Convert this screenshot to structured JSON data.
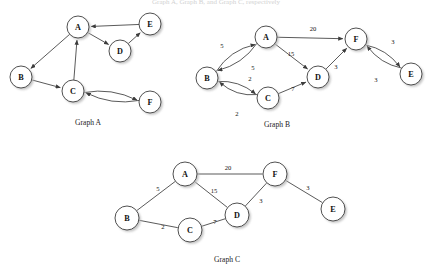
{
  "figure": {
    "background_color": "#ffffff",
    "node_fill": "#ffffff",
    "node_stroke": "#3c3c3c",
    "edge_color": "#3c3c3c",
    "text_color": "#111111",
    "top_clipped_text": "Graph A, Graph B, and Graph C, respectively"
  },
  "graphs": [
    {
      "id": "graph-a",
      "caption": "Graph A",
      "caption_pos": {
        "x": 88,
        "y": 122
      },
      "directed": true,
      "weighted": false,
      "nodes": [
        {
          "id": "A",
          "label": "A",
          "x": 78,
          "y": 27,
          "r": 11
        },
        {
          "id": "B",
          "label": "B",
          "x": 21,
          "y": 77,
          "r": 11
        },
        {
          "id": "C",
          "label": "C",
          "x": 73,
          "y": 91,
          "r": 11
        },
        {
          "id": "D",
          "label": "D",
          "x": 120,
          "y": 51,
          "r": 11
        },
        {
          "id": "E",
          "label": "E",
          "x": 150,
          "y": 24,
          "r": 11
        },
        {
          "id": "F",
          "label": "F",
          "x": 150,
          "y": 102,
          "r": 11
        }
      ],
      "edges": [
        {
          "from": "A",
          "to": "B",
          "weight": "",
          "curve": 0
        },
        {
          "from": "A",
          "to": "D",
          "weight": "",
          "curve": 0
        },
        {
          "from": "E",
          "to": "A",
          "weight": "",
          "curve": 0
        },
        {
          "from": "D",
          "to": "E",
          "weight": "",
          "curve": 0
        },
        {
          "from": "B",
          "to": "C",
          "weight": "",
          "curve": 0
        },
        {
          "from": "C",
          "to": "A",
          "weight": "",
          "curve": 0
        },
        {
          "from": "C",
          "to": "F",
          "weight": "",
          "curve": -9
        },
        {
          "from": "F",
          "to": "C",
          "weight": "",
          "curve": -9
        }
      ]
    },
    {
      "id": "graph-b",
      "caption": "Graph B",
      "caption_pos": {
        "x": 277,
        "y": 124
      },
      "directed": true,
      "weighted": true,
      "nodes": [
        {
          "id": "A",
          "label": "A",
          "x": 266,
          "y": 37,
          "r": 11
        },
        {
          "id": "B",
          "label": "B",
          "x": 207,
          "y": 78,
          "r": 11
        },
        {
          "id": "C",
          "label": "C",
          "x": 268,
          "y": 98,
          "r": 11
        },
        {
          "id": "D",
          "label": "D",
          "x": 318,
          "y": 77,
          "r": 11
        },
        {
          "id": "E",
          "label": "E",
          "x": 411,
          "y": 74,
          "r": 11
        },
        {
          "id": "F",
          "label": "F",
          "x": 356,
          "y": 39,
          "r": 11
        }
      ],
      "edges": [
        {
          "from": "B",
          "to": "A",
          "weight": "5",
          "label_pos": {
            "x": 222,
            "y": 45
          },
          "curve": -10
        },
        {
          "from": "A",
          "to": "B",
          "weight": "5",
          "label_pos": {
            "x": 253,
            "y": 67
          },
          "curve": -9
        },
        {
          "from": "A",
          "to": "F",
          "weight": "20",
          "label_pos": {
            "x": 313,
            "y": 28
          },
          "curve": 0
        },
        {
          "from": "A",
          "to": "D",
          "weight": "15",
          "label_pos": {
            "x": 291,
            "y": 53
          },
          "curve": 0
        },
        {
          "from": "B",
          "to": "C",
          "weight": "2",
          "label_pos": {
            "x": 250,
            "y": 78
          },
          "curve": -8
        },
        {
          "from": "C",
          "to": "B",
          "weight": "2",
          "label_pos": {
            "x": 237,
            "y": 113
          },
          "curve": -9
        },
        {
          "from": "C",
          "to": "D",
          "weight": "7",
          "label_pos": {
            "x": 293,
            "y": 88
          },
          "curve": 0
        },
        {
          "from": "D",
          "to": "F",
          "weight": "3",
          "label_pos": {
            "x": 336,
            "y": 66
          },
          "curve": 0
        },
        {
          "from": "F",
          "to": "E",
          "weight": "3",
          "label_pos": {
            "x": 393,
            "y": 41
          },
          "curve": -8
        },
        {
          "from": "E",
          "to": "F",
          "weight": "3",
          "label_pos": {
            "x": 376,
            "y": 79
          },
          "curve": -8
        }
      ]
    },
    {
      "id": "graph-c",
      "caption": "Graph C",
      "caption_pos": {
        "x": 227,
        "y": 259
      },
      "directed": false,
      "weighted": true,
      "nodes": [
        {
          "id": "A",
          "label": "A",
          "x": 185,
          "y": 174,
          "r": 12
        },
        {
          "id": "B",
          "label": "B",
          "x": 127,
          "y": 218,
          "r": 12
        },
        {
          "id": "C",
          "label": "C",
          "x": 190,
          "y": 230,
          "r": 12
        },
        {
          "id": "D",
          "label": "D",
          "x": 237,
          "y": 215,
          "r": 12
        },
        {
          "id": "E",
          "label": "E",
          "x": 333,
          "y": 209,
          "r": 12
        },
        {
          "id": "F",
          "label": "F",
          "x": 275,
          "y": 174,
          "r": 12
        }
      ],
      "edges": [
        {
          "from": "A",
          "to": "F",
          "weight": "20",
          "label_pos": {
            "x": 228,
            "y": 167
          },
          "curve": 0
        },
        {
          "from": "A",
          "to": "B",
          "weight": "5",
          "label_pos": {
            "x": 158,
            "y": 188
          },
          "curve": 0
        },
        {
          "from": "A",
          "to": "D",
          "weight": "15",
          "label_pos": {
            "x": 214,
            "y": 190
          },
          "curve": 0
        },
        {
          "from": "B",
          "to": "C",
          "weight": "2",
          "label_pos": {
            "x": 163,
            "y": 226
          },
          "curve": 0
        },
        {
          "from": "C",
          "to": "D",
          "weight": "7",
          "label_pos": {
            "x": 215,
            "y": 221
          },
          "curve": 0
        },
        {
          "from": "D",
          "to": "F",
          "weight": "3",
          "label_pos": {
            "x": 261,
            "y": 200
          },
          "curve": 0
        },
        {
          "from": "F",
          "to": "E",
          "weight": "3",
          "label_pos": {
            "x": 308,
            "y": 187
          },
          "curve": 0
        }
      ]
    }
  ]
}
